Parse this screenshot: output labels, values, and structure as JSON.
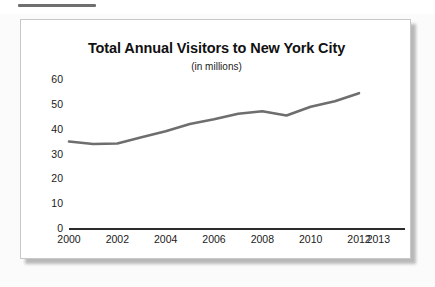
{
  "page": {
    "top_rule": "",
    "background_color": "#fbfbfb"
  },
  "chart_panel": {
    "border_color": "#c8c8c8",
    "background_color": "#ffffff",
    "shadow_color": "#b9b9b9"
  },
  "chart_data": {
    "type": "line",
    "title": "Total Annual Visitors to New York City",
    "subtitle": "(in millions)",
    "xlabel": "",
    "ylabel": "",
    "series_color": "#6e6e6e",
    "axis_color": "#2b2b2b",
    "grid": false,
    "legend": null,
    "xlim": [
      2000,
      2013
    ],
    "ylim": [
      0,
      60
    ],
    "y_ticks": [
      0,
      10,
      20,
      30,
      40,
      50,
      60
    ],
    "y_tick_labels": [
      "0",
      "10",
      "20",
      "30",
      "40",
      "50",
      "60"
    ],
    "x_ticks": [
      2000,
      2002,
      2004,
      2006,
      2008,
      2010,
      2012,
      2013
    ],
    "x_tick_labels": [
      "2000",
      "2002",
      "2004",
      "2006",
      "2008",
      "2010",
      "2012",
      "2013"
    ],
    "x": [
      2000,
      2001,
      2002,
      2003,
      2004,
      2005,
      2006,
      2007,
      2008,
      2009,
      2010,
      2011,
      2012
    ],
    "values": [
      34.8,
      33.8,
      34.0,
      36.5,
      39.0,
      41.9,
      43.8,
      46.0,
      47.0,
      45.3,
      48.8,
      51.0,
      54.3
    ]
  }
}
